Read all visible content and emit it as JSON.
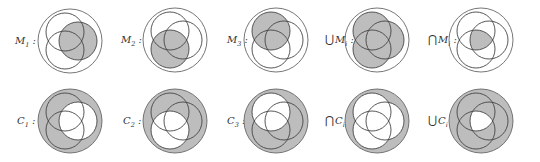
{
  "colors": {
    "fill": "#bdbdbd",
    "stroke": "#444444",
    "outer_stroke": "#666666",
    "background": "#ffffff"
  },
  "geometry": {
    "outer_radius": 32,
    "inner_radius": 19,
    "circle_offsets": {
      "A_top_left": [
        -5,
        -9
      ],
      "B_right": [
        8,
        0
      ],
      "C_bottom_left": [
        -5,
        9
      ]
    }
  },
  "rows": [
    {
      "name": "M-row",
      "panels": [
        {
          "id": "M1",
          "op": "",
          "sym": "M",
          "sub": "1",
          "suffix": " :",
          "shade": "B",
          "center": [
            70,
            41
          ],
          "label_x": 14
        },
        {
          "id": "M2",
          "op": "",
          "sym": "M",
          "sub": "2",
          "suffix": " :",
          "shade": "C",
          "center": [
            175,
            40
          ],
          "label_x": 120
        },
        {
          "id": "M3",
          "op": "",
          "sym": "M",
          "sub": "3",
          "suffix": " :",
          "shade": "A",
          "center": [
            276,
            40
          ],
          "label_x": 226
        },
        {
          "id": "union-M",
          "op": "⋃",
          "sym": "M",
          "sub": "i",
          "suffix": " :",
          "shade": "union",
          "center": [
            377,
            40
          ],
          "label_x": 325
        },
        {
          "id": "intersect-M",
          "op": "⋂",
          "sym": "M",
          "sub": "i",
          "suffix": " :",
          "shade": "intersection",
          "center": [
            481,
            40
          ],
          "label_x": 428
        }
      ]
    },
    {
      "name": "C-row",
      "panels": [
        {
          "id": "C1",
          "op": "",
          "sym": "C",
          "sub": "1",
          "suffix": " :",
          "shade": "not-B",
          "center": [
            70,
            121
          ],
          "label_x": 16
        },
        {
          "id": "C2",
          "op": "",
          "sym": "C",
          "sub": "2",
          "suffix": " :",
          "shade": "not-C",
          "center": [
            175,
            121
          ],
          "label_x": 122
        },
        {
          "id": "C3",
          "op": "",
          "sym": "C",
          "sub": "3",
          "suffix": " :",
          "shade": "not-A",
          "center": [
            276,
            121
          ],
          "label_x": 226
        },
        {
          "id": "intersect-C",
          "op": "⋂",
          "sym": "C",
          "sub": "i",
          "suffix": " :",
          "shade": "not-union",
          "center": [
            377,
            121
          ],
          "label_x": 325
        },
        {
          "id": "union-C",
          "op": "⋃",
          "sym": "C",
          "sub": "i",
          "suffix": " :",
          "shade": "not-intersection",
          "center": [
            481,
            121
          ],
          "label_x": 428
        }
      ]
    }
  ]
}
